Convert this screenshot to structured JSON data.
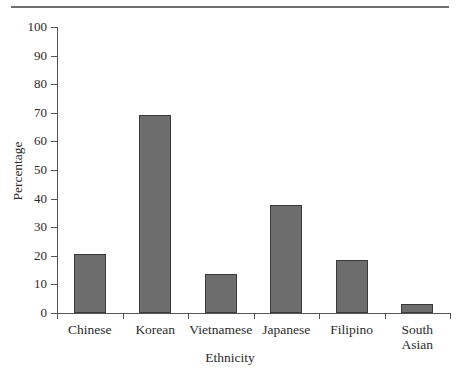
{
  "chart_data": {
    "type": "bar",
    "title": "",
    "subtitle": "",
    "xlabel": "Ethnicity",
    "ylabel": "Percentage",
    "categories": [
      "Chinese",
      "Korean",
      "Vietnamese",
      "Japanese",
      "Filipino",
      "South\nAsian"
    ],
    "values": [
      20.6,
      69.2,
      13.6,
      37.8,
      18.5,
      3.1
    ],
    "ylim": [
      0,
      100
    ],
    "ytick_labels": [
      "100",
      "90",
      "80",
      "70",
      "60",
      "50",
      "40",
      "30",
      "20",
      "10",
      "0"
    ],
    "ytick_values": [
      100,
      90,
      80,
      70,
      60,
      50,
      40,
      30,
      20,
      10,
      0
    ],
    "grid": false,
    "legend": null,
    "legend_position": "none",
    "bar_fill_color": "#6d6d6d",
    "bar_edge_color": "#3a3a3a",
    "axis_color": "#555555",
    "rule_color": "#6e6e6e",
    "background_color": "#ffffff",
    "annotations": []
  }
}
